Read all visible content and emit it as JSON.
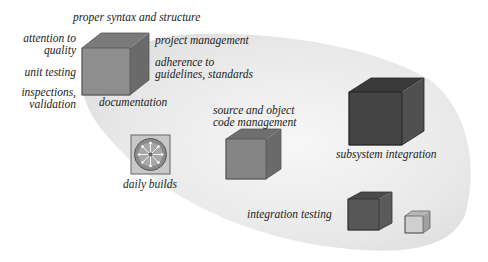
{
  "labels": {
    "top": "proper syntax and structure",
    "attention": [
      "attention to",
      "quality"
    ],
    "unit_testing": "unit testing",
    "inspections": [
      "inspections,",
      "validation"
    ],
    "documentation": "documentation",
    "project_management": "project management",
    "adherence": [
      "adherence to",
      "guidelines, standards"
    ],
    "source_code": [
      "source and object",
      "code management"
    ],
    "daily_builds": "daily builds",
    "subsystem_integration": "subsystem integration",
    "integration_testing": "integration testing"
  },
  "colors": {
    "region": "#e6e6e6",
    "cube_medium": "#8a8a8a",
    "cube_dark": "#444444",
    "cube_light": "#c8c8c8"
  }
}
